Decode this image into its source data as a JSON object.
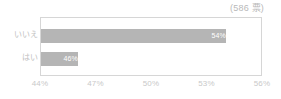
{
  "header": {
    "note": "(586 票)"
  },
  "chart_data": {
    "type": "bar",
    "orientation": "horizontal",
    "title": "",
    "subtitle": "",
    "xlabel": "",
    "ylabel": "",
    "categories": [
      "いいえ",
      "はい"
    ],
    "values": [
      54,
      46
    ],
    "value_labels": [
      "54%",
      "46%"
    ],
    "xlim": [
      44,
      56
    ],
    "xticks": [
      44,
      47,
      50,
      53,
      56
    ],
    "xtick_labels": [
      "44%",
      "47%",
      "50%",
      "53%",
      "56%"
    ],
    "grid": false,
    "legend": false,
    "total_votes": 586,
    "series": [
      {
        "name": "投票率",
        "values": [
          54,
          46
        ]
      }
    ],
    "colors": {
      "bar": "#b5b5b5",
      "bar_label": "#ffffff",
      "axis_text": "#c9c9c9",
      "category_text": "#c2c2c2",
      "plot_border": "#d6d6d6",
      "note_text": "#b9b9b9",
      "background": "#ffffff"
    }
  }
}
